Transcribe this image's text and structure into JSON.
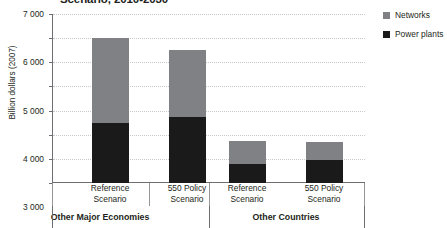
{
  "chart_data": {
    "type": "bar",
    "subtype": "stacked-bar-grouped",
    "title": "Scenario, 2010-2030",
    "xlabel": "",
    "ylabel": "Billion dollars (2007)",
    "ylim": [
      0,
      7000
    ],
    "ytick_values": [
      7000,
      6000,
      5000,
      4000,
      3000,
      2000,
      1000,
      0
    ],
    "ytick_labels": [
      "7 000",
      "6 000",
      "5 000",
      "4 000",
      "3 000",
      "2 000",
      "1 000",
      "0"
    ],
    "grid": true,
    "grid_style": "dotted-horizontal",
    "legend_position": "right",
    "categories": [
      "Reference Scenario",
      "550 Policy Scenario",
      "Reference Scenario",
      "550 Policy Scenario"
    ],
    "groups": [
      {
        "label": "Other Major Economies",
        "category_indices": [
          0,
          1
        ]
      },
      {
        "label": "Other Countries",
        "category_indices": [
          2,
          3
        ]
      }
    ],
    "series": [
      {
        "name": "Power plants",
        "color": "#1a1a1a",
        "values": [
          2500,
          2730,
          800,
          950
        ]
      },
      {
        "name": "Networks",
        "color": "#808184",
        "values": [
          3500,
          2770,
          950,
          750
        ]
      }
    ],
    "totals": [
      6000,
      5500,
      1750,
      1700
    ]
  },
  "axis": {
    "y_title": "Billion dollars (2007)",
    "ticks": [
      {
        "label": "7 000",
        "value": 7000
      },
      {
        "label": "6 000",
        "value": 6000
      },
      {
        "label": "5 000",
        "value": 5000
      },
      {
        "label": "4 000",
        "value": 4000
      },
      {
        "label": "3 000",
        "value": 3000
      },
      {
        "label": "2 000",
        "value": 2000
      },
      {
        "label": "1 000",
        "value": 1000
      },
      {
        "label": "0",
        "value": 0
      }
    ]
  },
  "categories": [
    {
      "line1": "Reference",
      "line2": "Scenario"
    },
    {
      "line1": "550 Policy",
      "line2": "Scenario"
    },
    {
      "line1": "Reference",
      "line2": "Scenario"
    },
    {
      "line1": "550 Policy",
      "line2": "Scenario"
    }
  ],
  "groups": [
    {
      "label": "Other Major Economies"
    },
    {
      "label": "Other Countries"
    }
  ],
  "legend": {
    "items": [
      {
        "label": "Networks",
        "color": "#808184"
      },
      {
        "label": "Power plants",
        "color": "#1a1a1a"
      }
    ]
  },
  "title": "Scenario, 2010-2030"
}
